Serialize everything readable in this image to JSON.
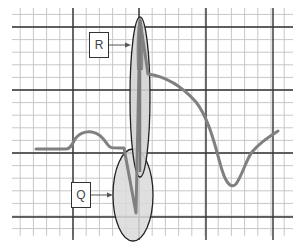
{
  "diagram": {
    "type": "ecg-waveform",
    "grid": {
      "minor_color": "#c8c8c8",
      "major_color": "#333333",
      "x_start": 12,
      "x_end": 293,
      "y_start": 8,
      "y_end": 236,
      "major_vertical_x": [
        73,
        139,
        206,
        273
      ],
      "major_horizontal_y": [
        27,
        90,
        153,
        217
      ]
    },
    "waveform": {
      "color": "#808080",
      "segments": [
        "baseline",
        "P wave",
        "Q wave",
        "R wave",
        "S-T descent",
        "T-inverted trough",
        "recovery"
      ]
    },
    "labels": [
      {
        "id": "R",
        "text": "R",
        "box": {
          "x": 89,
          "y": 32,
          "w": 20,
          "h": 26
        },
        "arrow_to": {
          "x": 131,
          "y": 45
        }
      },
      {
        "id": "Q",
        "text": "Q",
        "box": {
          "x": 71,
          "y": 182,
          "w": 20,
          "h": 26
        },
        "arrow_to": {
          "x": 113,
          "y": 195
        }
      }
    ],
    "highlights": [
      {
        "id": "R-ellipse",
        "cx": 140,
        "cy": 97,
        "rx": 10,
        "ry": 80,
        "fill": "#d3d3d3"
      },
      {
        "id": "Q-ellipse",
        "cx": 133,
        "cy": 195,
        "rx": 20,
        "ry": 46,
        "fill": "#d9d9d9"
      }
    ]
  }
}
